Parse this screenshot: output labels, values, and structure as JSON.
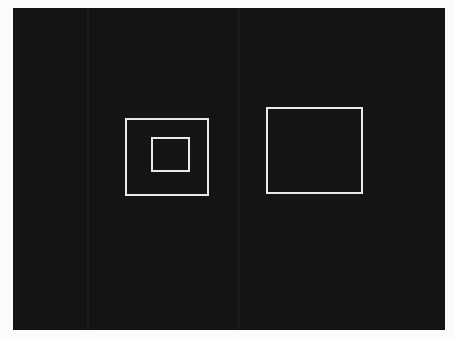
{
  "figure": {
    "background_color": "#141414",
    "page_color": "#fbfbfb",
    "stroke_color": "#e9e9e6",
    "shapes": [
      {
        "id": "left-outer-square",
        "type": "square-outline",
        "group": "left",
        "nested_child": "left-inner-square"
      },
      {
        "id": "left-inner-square",
        "type": "square-outline",
        "group": "left",
        "nested_in": "left-outer-square"
      },
      {
        "id": "right-square",
        "type": "square-outline",
        "group": "right"
      }
    ]
  }
}
